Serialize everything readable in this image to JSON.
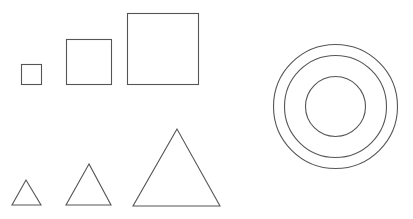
{
  "canvas": {
    "width": 413,
    "height": 219,
    "background": "#ffffff",
    "stroke": "#555555"
  },
  "squares": [
    {
      "name": "small-square",
      "x": 21,
      "y": 64,
      "size": 20
    },
    {
      "name": "medium-square",
      "x": 66,
      "y": 39,
      "size": 45
    },
    {
      "name": "large-square",
      "x": 127,
      "y": 13,
      "size": 71
    }
  ],
  "triangles": [
    {
      "name": "small-triangle",
      "points": "26,180 12,205 41,205"
    },
    {
      "name": "medium-triangle",
      "points": "89,164 66,205 111,205"
    },
    {
      "name": "large-triangle",
      "points": "177,129 133,206 220,206"
    }
  ],
  "circles": [
    {
      "name": "outer-circle",
      "cx": 335.5,
      "cy": 106.5,
      "r": 62
    },
    {
      "name": "middle-circle",
      "cx": 335.5,
      "cy": 106.5,
      "r": 51
    },
    {
      "name": "inner-circle",
      "cx": 335.5,
      "cy": 106.5,
      "r": 30
    }
  ]
}
